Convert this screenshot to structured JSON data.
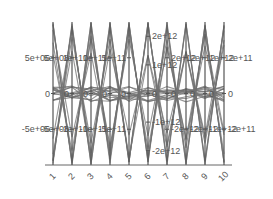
{
  "chart_data": {
    "type": "parallel_coordinates",
    "title": "",
    "xlabel": "",
    "ylabel": "",
    "grid": false,
    "legend": null,
    "categories": [
      "1",
      "2",
      "3",
      "4",
      "5",
      "6",
      "7",
      "8",
      "9",
      "10"
    ],
    "axes": [
      {
        "name": "1",
        "range": [
          -10000000.0,
          10000000.0
        ],
        "ticks": [
          {
            "value": 5000000.0,
            "label": "5e+06"
          },
          {
            "value": 0,
            "label": "0"
          },
          {
            "value": -5000000.0,
            "label": "-5e+06"
          }
        ]
      },
      {
        "name": "2",
        "range": [
          -1000000000.0,
          1000000000.0
        ],
        "ticks": [
          {
            "value": 500000000.0,
            "label": "5e+08"
          },
          {
            "value": 0,
            "label": "0"
          },
          {
            "value": -500000000.0,
            "label": "-5e+08"
          }
        ]
      },
      {
        "name": "3",
        "range": [
          -20000000000.0,
          20000000000.0
        ],
        "ticks": [
          {
            "value": 10000000000.0,
            "label": "1e+10"
          },
          {
            "value": 0,
            "label": "0"
          },
          {
            "value": -10000000000.0,
            "label": "-1e+10"
          }
        ]
      },
      {
        "name": "4",
        "range": [
          -200000000000.0,
          200000000000.0
        ],
        "ticks": [
          {
            "value": 100000000000.0,
            "label": "1e+11"
          },
          {
            "value": 0,
            "label": "0"
          },
          {
            "value": -100000000000.0,
            "label": "-1e+11"
          }
        ]
      },
      {
        "name": "5",
        "range": [
          -1000000000000.0,
          1000000000000.0
        ],
        "ticks": [
          {
            "value": 500000000000.0,
            "label": "5e+11"
          },
          {
            "value": 0,
            "label": "0"
          },
          {
            "value": -500000000000.0,
            "label": "-5e+11"
          }
        ]
      },
      {
        "name": "6",
        "range": [
          -2500000000000.0,
          2500000000000.0
        ],
        "ticks": [
          {
            "value": 2000000000000.0,
            "label": "2e+12"
          },
          {
            "value": 1000000000000.0,
            "label": "1e+12"
          },
          {
            "value": 0,
            "label": "0"
          },
          {
            "value": -1000000000000.0,
            "label": "-1e+12"
          },
          {
            "value": -2000000000000.0,
            "label": "-2e+12"
          }
        ]
      },
      {
        "name": "7",
        "range": [
          -4000000000000.0,
          4000000000000.0
        ],
        "ticks": [
          {
            "value": 2000000000000.0,
            "label": "2e+12"
          },
          {
            "value": 0,
            "label": "0"
          },
          {
            "value": -2000000000000.0,
            "label": "-2e+12"
          }
        ]
      },
      {
        "name": "8",
        "range": [
          -4000000000000.0,
          4000000000000.0
        ],
        "ticks": [
          {
            "value": 2000000000000.0,
            "label": "2e+12"
          },
          {
            "value": 0,
            "label": "0"
          },
          {
            "value": -2000000000000.0,
            "label": "-2e+12"
          }
        ]
      },
      {
        "name": "9",
        "range": [
          -2000000000000.0,
          2000000000000.0
        ],
        "ticks": [
          {
            "value": 1000000000000.0,
            "label": "1e+12"
          },
          {
            "value": 0,
            "label": "0"
          },
          {
            "value": -1000000000000.0,
            "label": "-1e+12"
          }
        ]
      },
      {
        "name": "10",
        "range": [
          -400000000000.0,
          400000000000.0
        ],
        "ticks": [
          {
            "value": 200000000000.0,
            "label": "2e+11"
          },
          {
            "value": 0,
            "label": "0"
          },
          {
            "value": -200000000000.0,
            "label": "-2e+11"
          }
        ]
      }
    ],
    "series_note": "Many polylines zigzagging between axis extremes with a dense cluster near zero on every axis",
    "line_color": "#707070"
  }
}
